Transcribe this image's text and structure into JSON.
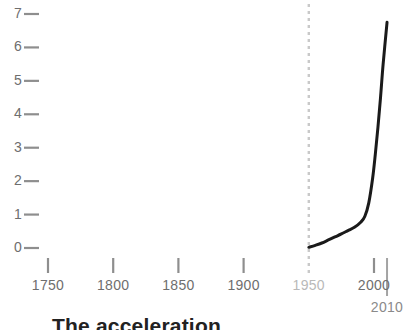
{
  "chart_data": {
    "type": "line",
    "title": "The acceleration",
    "xlabel": "",
    "ylabel": "",
    "xlim": [
      1740,
      2012
    ],
    "ylim": [
      0,
      7.3
    ],
    "grid": false,
    "legend": null,
    "x_ticks": [
      {
        "value": 1750,
        "label": "1750",
        "dim": false
      },
      {
        "value": 1800,
        "label": "1800",
        "dim": false
      },
      {
        "value": 1850,
        "label": "1850",
        "dim": false
      },
      {
        "value": 1900,
        "label": "1900",
        "dim": false
      },
      {
        "value": 1950,
        "label": "1950",
        "dim": true
      },
      {
        "value": 2000,
        "label": "2000",
        "dim": false
      }
    ],
    "end_tick": {
      "value": 2010,
      "label": "2010"
    },
    "y_ticks": [
      {
        "value": 0,
        "label": "0"
      },
      {
        "value": 1,
        "label": "1"
      },
      {
        "value": 2,
        "label": "2"
      },
      {
        "value": 3,
        "label": "3"
      },
      {
        "value": 4,
        "label": "4"
      },
      {
        "value": 5,
        "label": "5"
      },
      {
        "value": 6,
        "label": "6"
      },
      {
        "value": 7,
        "label": "7"
      }
    ],
    "annotations": [
      {
        "name": "reference-line-1950",
        "type": "vline",
        "x": 1950,
        "style": "dashed",
        "color": "#c9c9c9"
      }
    ],
    "series": [
      {
        "name": "value",
        "color": "#1a1a1a",
        "x": [
          1950,
          1955,
          1960,
          1965,
          1970,
          1975,
          1980,
          1985,
          1990,
          1993,
          1996,
          1999,
          2001,
          2003,
          2005,
          2007,
          2010
        ],
        "values": [
          0.02,
          0.08,
          0.15,
          0.24,
          0.33,
          0.42,
          0.52,
          0.62,
          0.78,
          0.95,
          1.35,
          2.1,
          2.8,
          3.6,
          4.5,
          5.5,
          6.75
        ]
      }
    ]
  }
}
